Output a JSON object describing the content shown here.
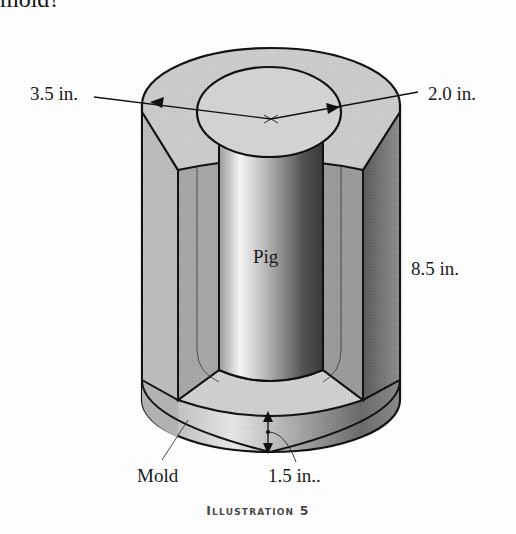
{
  "header": {
    "fragment_text": "mold?"
  },
  "figure": {
    "caption": "Illustration 5",
    "labels": {
      "outer_diameter": "3.5 in.",
      "inner_diameter": "2.0 in.",
      "pig": "Pig",
      "height": "8.5 in.",
      "mold": "Mold",
      "bottom_thickness": "1.5 in.."
    },
    "colors": {
      "mold_surface": "#c8c8c8",
      "mold_shadow": "#6e6e6e",
      "pig_light": "#f2f2f2",
      "pig_dark": "#3c3c3c",
      "outline": "#111111"
    }
  }
}
